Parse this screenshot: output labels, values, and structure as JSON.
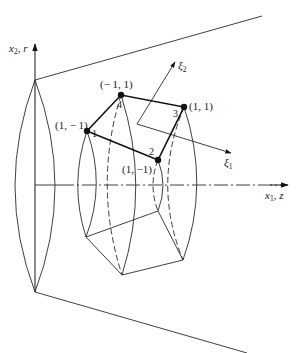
{
  "figure": {
    "axes": {
      "vertical_label": "x",
      "vertical_sub": "2",
      "vertical_suffix": ", r",
      "horizontal_label": "x",
      "horizontal_sub": "1",
      "horizontal_suffix": ", z"
    },
    "local_axes": {
      "xi1_label": "ξ",
      "xi1_sub": "1",
      "xi2_label": "ξ",
      "xi2_sub": "2"
    },
    "nodes": [
      {
        "id": "1",
        "coord_label": "(1, − 1)",
        "x": 87,
        "y": 131
      },
      {
        "id": "2",
        "coord_label": "(1, −1)",
        "x": 158,
        "y": 160
      },
      {
        "id": "3",
        "coord_label": "(1, 1)",
        "x": 184,
        "y": 107
      },
      {
        "id": "4",
        "coord_label": "(− 1, 1)",
        "x": 121,
        "y": 95
      }
    ],
    "colors": {
      "line": "#111111",
      "background": "#ffffff"
    }
  }
}
